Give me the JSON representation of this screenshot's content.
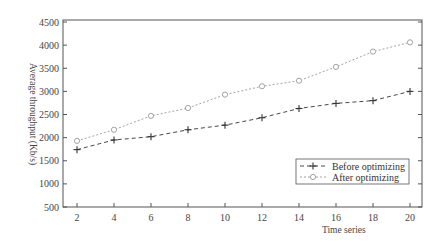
{
  "chart_data": {
    "type": "line",
    "title": "",
    "xlabel": "Time series",
    "ylabel": "Average throughput (Kb/s)",
    "x": [
      2,
      4,
      6,
      8,
      10,
      12,
      14,
      16,
      18,
      20
    ],
    "xticks": [
      "2",
      "4",
      "6",
      "8",
      "10",
      "12",
      "14",
      "16",
      "18",
      "20"
    ],
    "yticks": [
      "500",
      "1000",
      "1500",
      "2000",
      "2500",
      "3000",
      "3500",
      "4000",
      "4500"
    ],
    "xlim": [
      2,
      20
    ],
    "ylim": [
      500,
      4500
    ],
    "grid": false,
    "legend_position": "lower right",
    "series": [
      {
        "name": "Before optimizing",
        "marker": "plus",
        "line_style": "dashed",
        "color": "#333333",
        "values": [
          1740,
          1950,
          2020,
          2170,
          2270,
          2430,
          2630,
          2740,
          2800,
          3000
        ]
      },
      {
        "name": "After optimizing",
        "marker": "circle",
        "line_style": "dotted",
        "color": "#999999",
        "values": [
          1930,
          2170,
          2470,
          2640,
          2930,
          3110,
          3230,
          3530,
          3860,
          4060
        ]
      }
    ]
  }
}
